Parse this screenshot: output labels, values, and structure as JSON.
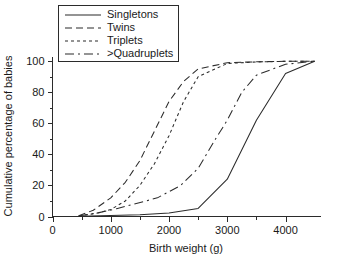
{
  "chart_data": {
    "type": "line",
    "title": "",
    "xlabel": "Birth weight (g)",
    "ylabel": "Cumulative percentage of babies",
    "xlim": [
      0,
      4600
    ],
    "ylim": [
      0,
      103
    ],
    "grid": false,
    "legend_position": "top-left",
    "xticks": [
      0,
      1000,
      2000,
      3000,
      4000
    ],
    "xtick_labels": [
      "0",
      "1000",
      "2000",
      "3000",
      "4000"
    ],
    "x_minor_ticks": [
      500,
      1500,
      2500,
      3500
    ],
    "yticks": [
      0,
      20,
      40,
      60,
      80,
      100
    ],
    "ytick_labels": [
      "0",
      "20",
      "40",
      "60",
      "80",
      "100"
    ],
    "y_minor_ticks": [
      10,
      30,
      50,
      70,
      90
    ],
    "series": [
      {
        "name": "Singletons",
        "dash": "solid",
        "dasharray": "none",
        "x": [
          450,
          1000,
          1500,
          2000,
          2500,
          3000,
          3500,
          4000,
          4500
        ],
        "y": [
          0.2,
          0.6,
          1.1,
          2.2,
          5.2,
          24.0,
          62.0,
          92.0,
          100.0
        ]
      },
      {
        "name": "Twins",
        "dash": "long-dash",
        "dasharray": "7,4",
        "x": [
          450,
          700,
          1000,
          1250,
          1500,
          1750,
          2000,
          2250,
          2500,
          3000,
          3500,
          4000,
          4500
        ],
        "y": [
          0.5,
          4.0,
          12.0,
          22.0,
          36.0,
          55.0,
          74.0,
          87.0,
          95.0,
          99.0,
          99.6,
          99.9,
          100.0
        ]
      },
      {
        "name": "Triplets",
        "dash": "short-dash",
        "dasharray": "3,3",
        "x": [
          450,
          750,
          1000,
          1250,
          1500,
          1750,
          2000,
          2250,
          2500,
          3000,
          3500,
          4000,
          4500
        ],
        "y": [
          0.4,
          2.0,
          4.5,
          10.0,
          20.0,
          34.0,
          52.0,
          74.0,
          90.0,
          98.5,
          99.5,
          99.9,
          100.0
        ]
      },
      {
        "name": ">Quadruplets",
        "dash": "dash-dot",
        "dasharray": "9,4,2,4",
        "x": [
          450,
          800,
          1100,
          1400,
          1800,
          2200,
          2500,
          2800,
          3000,
          3250,
          3500,
          4000,
          4500
        ],
        "y": [
          0.3,
          2.5,
          5.0,
          8.0,
          12.0,
          20.0,
          31.0,
          50.0,
          62.0,
          80.0,
          91.0,
          98.0,
          100.0
        ]
      }
    ]
  },
  "legend": {
    "entries": [
      {
        "label": "Singletons"
      },
      {
        "label": "Twins"
      },
      {
        "label": "Triplets"
      },
      {
        "label": ">Quadruplets"
      }
    ]
  },
  "colors": {
    "ink": "#2b2b2b",
    "background": "#ffffff"
  }
}
